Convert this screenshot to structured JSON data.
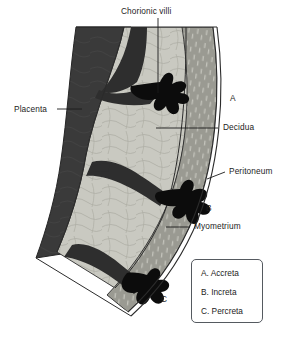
{
  "title": "Chorionic villi",
  "diagram": {
    "name": "placenta-accreta-spectrum-cross-section",
    "labels": [
      {
        "id": "chorionic-villi",
        "text": "Chorionic villi"
      },
      {
        "id": "placenta",
        "text": "Placenta"
      },
      {
        "id": "decidua",
        "text": "Decidua"
      },
      {
        "id": "peritoneum",
        "text": "Peritoneum"
      },
      {
        "id": "myometrium",
        "text": "Myometrium"
      }
    ],
    "markers": [
      {
        "id": "marker-a",
        "text": "A"
      },
      {
        "id": "marker-b",
        "text": "B"
      },
      {
        "id": "marker-c",
        "text": "C"
      }
    ],
    "colors": {
      "placenta": "#3a3a3a",
      "decidua": "#c9c9c1",
      "myometrium": "#9a9a92",
      "peritoneum": "#f2f2ef",
      "villi": "#0c0c0c",
      "outline": "#2b2b2b",
      "background": "#ffffff",
      "text": "#1c1c1c",
      "legend_border": "#555a60"
    }
  },
  "legend": {
    "items": [
      {
        "id": "legend-a",
        "text": "A. Accreta"
      },
      {
        "id": "legend-b",
        "text": "B. Increta"
      },
      {
        "id": "legend-c",
        "text": "C. Percreta"
      }
    ]
  }
}
